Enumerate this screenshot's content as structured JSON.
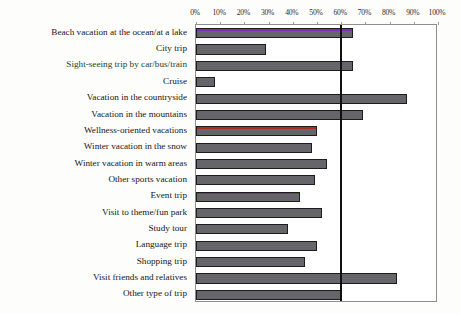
{
  "chart_data": {
    "type": "bar",
    "orientation": "horizontal",
    "title": "",
    "xlabel": "",
    "ylabel": "",
    "xlim": [
      0,
      100
    ],
    "grid": false,
    "legend": null,
    "tick_labels": [
      "0%",
      "10%",
      "20%",
      "30%",
      "40%",
      "50%",
      "60%",
      "70%",
      "80%",
      "90%",
      "100%"
    ],
    "tick_values": [
      0,
      10,
      20,
      30,
      40,
      50,
      60,
      70,
      80,
      90,
      100
    ],
    "reference_line": {
      "value": 60,
      "label": "60%",
      "color": "#101010"
    },
    "categories": [
      "Beach vacation at the ocean/at a lake",
      "City trip",
      "Sight-seeing trip by car/bus/train",
      "Cruise",
      "Vacation in the countryside",
      "Vacation in the mountains",
      "Wellness-oriented vacations",
      "Winter vacation in the snow",
      "Winter vacation in warm areas",
      "Other sports vacation",
      "Event trip",
      "Visit to theme/fun park",
      "Study tour",
      "Language trip",
      "Shopping trip",
      "Visit friends and relatives",
      "Other type of trip"
    ],
    "values": [
      65,
      29,
      65,
      8,
      87,
      69,
      50,
      48,
      54,
      49,
      43,
      52,
      38,
      50,
      45,
      83,
      60
    ],
    "bar_accents": [
      "#7b2fb5",
      null,
      null,
      null,
      null,
      null,
      "#b02a22",
      null,
      null,
      null,
      "#b02a22",
      null,
      null,
      null,
      null,
      null,
      null
    ],
    "bar_color": "#666569",
    "bar_edge_color": "#1c1c1c"
  }
}
